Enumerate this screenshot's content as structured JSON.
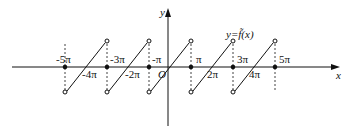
{
  "diagram": {
    "type": "sawtooth-function-graph",
    "function_label": "y=f̃(x)",
    "axes": {
      "x_label": "x",
      "y_label": "y",
      "origin_label": "O"
    },
    "tick_labels_above": [
      "-5π",
      "-3π",
      "-π",
      "π",
      "3π",
      "5π"
    ],
    "tick_labels_below": [
      "-4π",
      "-2π",
      "2π",
      "4π"
    ],
    "segments": [
      {
        "from": "-5π",
        "to": "-3π"
      },
      {
        "from": "-3π",
        "to": "-π"
      },
      {
        "from": "-π",
        "to": "π"
      },
      {
        "from": "π",
        "to": "3π"
      },
      {
        "from": "3π",
        "to": "5π"
      }
    ],
    "filled_points": [
      "-5π",
      "-3π",
      "-π",
      "π",
      "3π",
      "5π"
    ],
    "open_points": "segment endpoints at odd multiples of π (top and bottom)",
    "colors": {
      "stroke": "#111111",
      "background": "#ffffff"
    }
  }
}
